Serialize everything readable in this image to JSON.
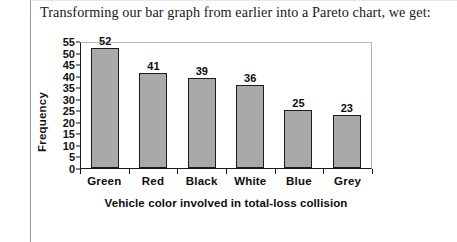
{
  "document": {
    "intro_text": "Transforming our bar graph from earlier into a Pareto chart, we get:"
  },
  "chart_data": {
    "type": "bar",
    "title": "",
    "xlabel": "Vehicle color involved in total-loss collision",
    "ylabel": "Frequency",
    "categories": [
      "Green",
      "Red",
      "Black",
      "White",
      "Blue",
      "Grey"
    ],
    "values": [
      52,
      41,
      39,
      36,
      25,
      23
    ],
    "ylim": [
      0,
      55
    ],
    "ytick_values": [
      55,
      50,
      45,
      40,
      35,
      30,
      25,
      20,
      15,
      10,
      5,
      0
    ],
    "grid": false,
    "legend": false,
    "sorted": "descending",
    "bar_fill_color": "#a9a9a9",
    "bar_border_color": "#1c1c1c",
    "axis_color": "#1a1a1a",
    "frame_color": "#b6b6b6"
  }
}
